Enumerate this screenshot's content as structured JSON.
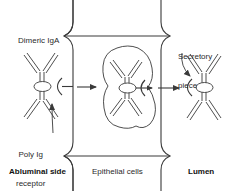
{
  "figure": {
    "stroke_color": "#3a3a3a",
    "text_color": "#2b2b2b",
    "background": "#ffffff"
  },
  "labels": {
    "dimeric_iga": "Dimeric IgA",
    "secretory_piece_line1": "Secretory",
    "secretory_piece_line2": "piece",
    "poly_ig_line1": "Poly Ig",
    "poly_ig_line2": "receptor",
    "abluminal_side": "Abluminal side",
    "epithelial_cells": "Epithelial cells",
    "lumen": "Lumen"
  }
}
